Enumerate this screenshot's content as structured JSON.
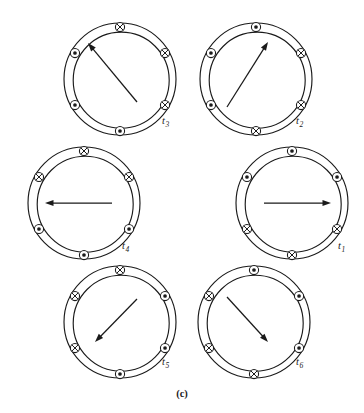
{
  "figure": {
    "caption": "(c)",
    "marker_legend": {
      "dot": "current out of page",
      "cross": "current into page"
    },
    "colors": {
      "stroke": "#1a1a1a",
      "background": "#ffffff"
    },
    "geometry": {
      "outer_radius": 56,
      "inner_radius": 48,
      "marker_radius": 52,
      "marker_ring_size": 4.6,
      "marker_angles_deg": [
        90,
        150,
        210,
        270,
        330,
        30
      ]
    },
    "panels": [
      {
        "id": "t3",
        "label": "t",
        "subscript": "3",
        "center": {
          "x": 120,
          "y": 79
        },
        "label_pos": {
          "x": 162,
          "y": 124
        },
        "arrow": {
          "angle_deg": 115,
          "length": 58,
          "tail": {
            "x": 137,
            "y": 102
          },
          "tip": {
            "x": 88,
            "y": 43
          },
          "direction": "upper-left"
        },
        "markers": [
          {
            "angle_deg": 90,
            "type": "cross"
          },
          {
            "angle_deg": 150,
            "type": "dot"
          },
          {
            "angle_deg": 210,
            "type": "dot"
          },
          {
            "angle_deg": 270,
            "type": "dot"
          },
          {
            "angle_deg": 330,
            "type": "cross"
          },
          {
            "angle_deg": 30,
            "type": "cross"
          }
        ]
      },
      {
        "id": "t2",
        "label": "t",
        "subscript": "2",
        "center": {
          "x": 256,
          "y": 79
        },
        "label_pos": {
          "x": 296,
          "y": 124
        },
        "arrow": {
          "angle_deg": 55,
          "length": 58,
          "tail": {
            "x": 227,
            "y": 107
          },
          "tip": {
            "x": 268,
            "y": 42
          },
          "direction": "upper-right"
        },
        "markers": [
          {
            "angle_deg": 90,
            "type": "dot"
          },
          {
            "angle_deg": 150,
            "type": "dot"
          },
          {
            "angle_deg": 210,
            "type": "dot"
          },
          {
            "angle_deg": 270,
            "type": "cross"
          },
          {
            "angle_deg": 330,
            "type": "cross"
          },
          {
            "angle_deg": 30,
            "type": "cross"
          }
        ]
      },
      {
        "id": "t4",
        "label": "t",
        "subscript": "4",
        "center": {
          "x": 84,
          "y": 203
        },
        "label_pos": {
          "x": 122,
          "y": 249
        },
        "arrow": {
          "angle_deg": 180,
          "length": 58,
          "tail": {
            "x": 112,
            "y": 203
          },
          "tip": {
            "x": 45,
            "y": 203
          },
          "direction": "left"
        },
        "markers": [
          {
            "angle_deg": 90,
            "type": "cross"
          },
          {
            "angle_deg": 150,
            "type": "cross"
          },
          {
            "angle_deg": 210,
            "type": "dot"
          },
          {
            "angle_deg": 270,
            "type": "dot"
          },
          {
            "angle_deg": 330,
            "type": "dot"
          },
          {
            "angle_deg": 30,
            "type": "cross"
          }
        ]
      },
      {
        "id": "t1",
        "label": "t",
        "subscript": "1",
        "center": {
          "x": 292,
          "y": 203
        },
        "label_pos": {
          "x": 338,
          "y": 249
        },
        "arrow": {
          "angle_deg": 0,
          "length": 58,
          "tail": {
            "x": 264,
            "y": 203
          },
          "tip": {
            "x": 331,
            "y": 203
          },
          "direction": "right"
        },
        "markers": [
          {
            "angle_deg": 90,
            "type": "dot"
          },
          {
            "angle_deg": 150,
            "type": "dot"
          },
          {
            "angle_deg": 210,
            "type": "cross"
          },
          {
            "angle_deg": 270,
            "type": "cross"
          },
          {
            "angle_deg": 330,
            "type": "cross"
          },
          {
            "angle_deg": 30,
            "type": "dot"
          }
        ]
      },
      {
        "id": "t5",
        "label": "t",
        "subscript": "5",
        "center": {
          "x": 120,
          "y": 322
        },
        "label_pos": {
          "x": 162,
          "y": 365
        },
        "arrow": {
          "angle_deg": 235,
          "length": 58,
          "tail": {
            "x": 137,
            "y": 299
          },
          "tip": {
            "x": 95,
            "y": 342
          },
          "direction": "lower-left"
        },
        "markers": [
          {
            "angle_deg": 90,
            "type": "cross"
          },
          {
            "angle_deg": 150,
            "type": "cross"
          },
          {
            "angle_deg": 210,
            "type": "cross"
          },
          {
            "angle_deg": 270,
            "type": "dot"
          },
          {
            "angle_deg": 330,
            "type": "dot"
          },
          {
            "angle_deg": 30,
            "type": "dot"
          }
        ]
      },
      {
        "id": "t6",
        "label": "t",
        "subscript": "6",
        "center": {
          "x": 254,
          "y": 322
        },
        "label_pos": {
          "x": 296,
          "y": 365
        },
        "arrow": {
          "angle_deg": 305,
          "length": 58,
          "tail": {
            "x": 227,
            "y": 297
          },
          "tip": {
            "x": 268,
            "y": 342
          },
          "direction": "lower-right"
        },
        "markers": [
          {
            "angle_deg": 90,
            "type": "dot"
          },
          {
            "angle_deg": 150,
            "type": "cross"
          },
          {
            "angle_deg": 210,
            "type": "cross"
          },
          {
            "angle_deg": 270,
            "type": "cross"
          },
          {
            "angle_deg": 330,
            "type": "dot"
          },
          {
            "angle_deg": 30,
            "type": "dot"
          }
        ]
      }
    ]
  }
}
